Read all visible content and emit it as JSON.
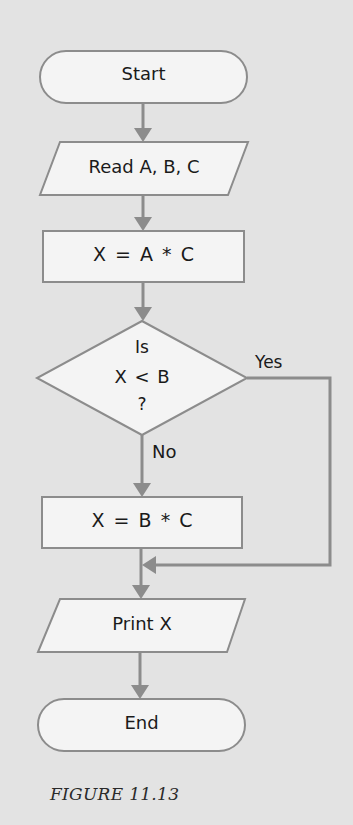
{
  "flowchart": {
    "nodes": [
      {
        "id": "start",
        "type": "terminal",
        "label": "Start"
      },
      {
        "id": "read",
        "type": "input",
        "label": "Read A, B, C"
      },
      {
        "id": "calc1",
        "type": "process",
        "label": "X = A * C"
      },
      {
        "id": "decision",
        "type": "decision",
        "lines": [
          "Is",
          "X < B",
          "?"
        ]
      },
      {
        "id": "calc2",
        "type": "process",
        "label": "X = B * C"
      },
      {
        "id": "print",
        "type": "output",
        "label": "Print X"
      },
      {
        "id": "end",
        "type": "terminal",
        "label": "End"
      }
    ],
    "edges": [
      {
        "from": "start",
        "to": "read"
      },
      {
        "from": "read",
        "to": "calc1"
      },
      {
        "from": "calc1",
        "to": "decision"
      },
      {
        "from": "decision",
        "to": "calc2",
        "label": "No"
      },
      {
        "from": "decision",
        "to": "print",
        "label": "Yes"
      },
      {
        "from": "calc2",
        "to": "print"
      },
      {
        "from": "print",
        "to": "end"
      }
    ],
    "branch_labels": {
      "yes": "Yes",
      "no": "No"
    }
  },
  "caption": "FIGURE 11.13",
  "colors": {
    "background": "#e3e3e3",
    "shape_fill": "#f4f4f4",
    "stroke": "#8a8a8a",
    "text": "#1a1a1a"
  }
}
